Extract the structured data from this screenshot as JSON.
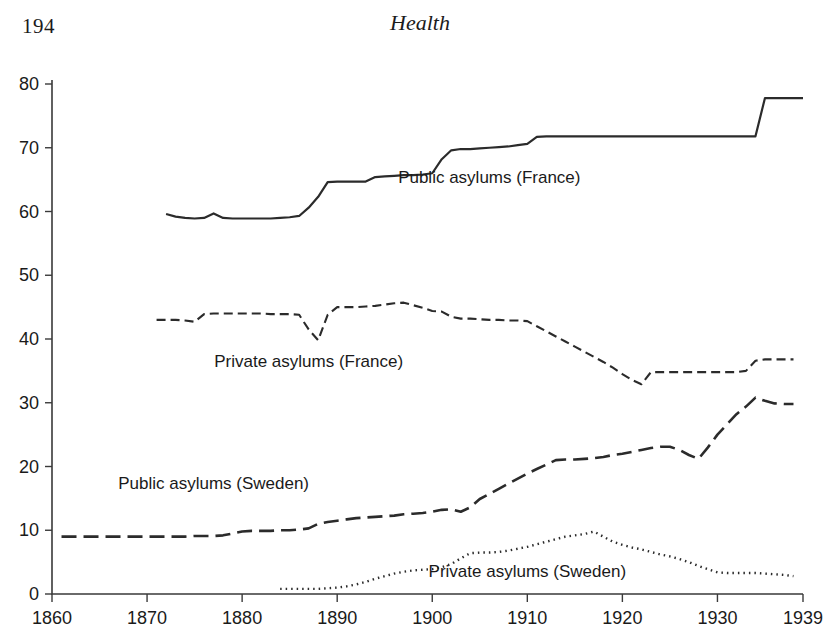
{
  "page": {
    "folio": "194",
    "running_head": "Health"
  },
  "chart_data": {
    "type": "line",
    "title": "",
    "xlabel": "",
    "ylabel": "",
    "xlim": [
      1860,
      1939
    ],
    "ylim": [
      0,
      80
    ],
    "grid": false,
    "legend_position": "inline-annotations",
    "x_ticks": [
      "1860",
      "1870",
      "1880",
      "1890",
      "1900",
      "1910",
      "1920",
      "1930",
      "1939"
    ],
    "x_tick_values": [
      1860,
      1870,
      1880,
      1890,
      1900,
      1910,
      1920,
      1930,
      1939
    ],
    "y_ticks": [
      "0",
      "10",
      "20",
      "30",
      "40",
      "50",
      "60",
      "70",
      "80"
    ],
    "y_tick_values": [
      0,
      10,
      20,
      30,
      40,
      50,
      60,
      70,
      80
    ],
    "series": [
      {
        "name": "Public asylums (France)",
        "style": "solid",
        "label_x": 1906,
        "label_y": 64.5,
        "x": [
          1872,
          1873,
          1874,
          1875,
          1876,
          1877,
          1878,
          1879,
          1880,
          1881,
          1882,
          1883,
          1884,
          1885,
          1886,
          1887,
          1888,
          1889,
          1890,
          1891,
          1892,
          1893,
          1894,
          1895,
          1896,
          1897,
          1898,
          1899,
          1900,
          1901,
          1902,
          1903,
          1904,
          1905,
          1906,
          1907,
          1908,
          1909,
          1910,
          1911,
          1912,
          1913,
          1914,
          1915,
          1916,
          1917,
          1918,
          1919,
          1920,
          1921,
          1922,
          1923,
          1924,
          1925,
          1926,
          1927,
          1928,
          1929,
          1930,
          1931,
          1932,
          1933,
          1934,
          1935,
          1936,
          1937,
          1938,
          1939
        ],
        "values": [
          59.6,
          59.2,
          59.0,
          58.9,
          59.0,
          59.7,
          59.0,
          58.9,
          58.9,
          58.9,
          58.9,
          58.9,
          59.0,
          59.1,
          59.3,
          60.6,
          62.3,
          64.6,
          64.7,
          64.7,
          64.7,
          64.7,
          65.4,
          65.5,
          65.6,
          65.7,
          65.7,
          65.8,
          66.0,
          68.2,
          69.6,
          69.8,
          69.8,
          69.9,
          70.0,
          70.1,
          70.2,
          70.4,
          70.6,
          71.7,
          71.8,
          71.8,
          71.8,
          71.8,
          71.8,
          71.8,
          71.8,
          71.8,
          71.8,
          71.8,
          71.8,
          71.8,
          71.8,
          71.8,
          71.8,
          71.8,
          71.8,
          71.8,
          71.8,
          71.8,
          71.8,
          71.8,
          71.8,
          77.8,
          77.8,
          77.8,
          77.8,
          77.8
        ]
      },
      {
        "name": "Private asylums (France)",
        "style": "dashed",
        "label_x": 1887,
        "label_y": 35.6,
        "x": [
          1871,
          1872,
          1873,
          1874,
          1875,
          1876,
          1877,
          1878,
          1879,
          1880,
          1881,
          1882,
          1883,
          1884,
          1885,
          1886,
          1887,
          1888,
          1889,
          1890,
          1891,
          1892,
          1893,
          1894,
          1895,
          1896,
          1897,
          1898,
          1899,
          1900,
          1901,
          1902,
          1903,
          1904,
          1905,
          1906,
          1907,
          1908,
          1909,
          1910,
          1911,
          1912,
          1913,
          1914,
          1915,
          1916,
          1917,
          1918,
          1919,
          1920,
          1921,
          1922,
          1923,
          1924,
          1925,
          1926,
          1927,
          1928,
          1929,
          1930,
          1931,
          1932,
          1933,
          1934,
          1935,
          1936,
          1937,
          1938
        ],
        "values": [
          43.0,
          43.0,
          43.0,
          42.9,
          42.7,
          43.9,
          44.0,
          44.0,
          44.0,
          44.0,
          44.0,
          44.0,
          43.9,
          43.9,
          43.9,
          43.8,
          41.5,
          39.8,
          43.8,
          45.0,
          45.0,
          45.0,
          45.1,
          45.2,
          45.4,
          45.6,
          45.7,
          45.3,
          44.9,
          44.4,
          44.3,
          43.5,
          43.2,
          43.2,
          43.1,
          43.0,
          43.0,
          42.9,
          42.9,
          42.8,
          42.0,
          41.2,
          40.4,
          39.6,
          38.8,
          38.0,
          37.2,
          36.4,
          35.5,
          34.5,
          33.6,
          32.9,
          34.8,
          34.8,
          34.8,
          34.8,
          34.8,
          34.8,
          34.8,
          34.8,
          34.8,
          34.8,
          35.0,
          36.6,
          36.8,
          36.8,
          36.8,
          36.8
        ]
      },
      {
        "name": "Public asylums (Sweden)",
        "style": "longdash",
        "label_x": 1877,
        "label_y": 16.4,
        "x": [
          1861,
          1862,
          1863,
          1864,
          1865,
          1866,
          1867,
          1868,
          1869,
          1870,
          1871,
          1872,
          1873,
          1874,
          1875,
          1876,
          1877,
          1878,
          1879,
          1880,
          1881,
          1882,
          1883,
          1884,
          1885,
          1886,
          1887,
          1888,
          1889,
          1890,
          1891,
          1892,
          1893,
          1894,
          1895,
          1896,
          1897,
          1898,
          1899,
          1900,
          1901,
          1902,
          1903,
          1904,
          1905,
          1906,
          1907,
          1908,
          1909,
          1910,
          1911,
          1912,
          1913,
          1914,
          1915,
          1916,
          1917,
          1918,
          1919,
          1920,
          1921,
          1922,
          1923,
          1924,
          1925,
          1926,
          1927,
          1928,
          1929,
          1930,
          1931,
          1932,
          1933,
          1934,
          1935,
          1936,
          1937,
          1938
        ],
        "values": [
          9.0,
          9.0,
          9.0,
          9.0,
          9.0,
          9.0,
          9.0,
          9.0,
          9.0,
          9.0,
          9.0,
          9.0,
          9.0,
          9.0,
          9.1,
          9.1,
          9.1,
          9.2,
          9.5,
          9.8,
          9.9,
          9.9,
          9.9,
          10.0,
          10.0,
          10.1,
          10.3,
          11.0,
          11.3,
          11.5,
          11.7,
          11.9,
          12.0,
          12.1,
          12.2,
          12.3,
          12.5,
          12.6,
          12.7,
          12.9,
          13.2,
          13.3,
          12.9,
          13.6,
          14.9,
          15.7,
          16.5,
          17.3,
          18.1,
          18.9,
          19.6,
          20.3,
          21.0,
          21.1,
          21.1,
          21.2,
          21.3,
          21.5,
          21.8,
          22.0,
          22.3,
          22.6,
          22.9,
          23.1,
          23.1,
          22.6,
          21.8,
          21.2,
          23.0,
          25.0,
          26.6,
          28.2,
          29.4,
          30.8,
          30.3,
          29.9,
          29.8,
          29.8
        ]
      },
      {
        "name": "Private asylums (Sweden)",
        "style": "dotted",
        "label_x": 1910,
        "label_y": 2.6,
        "x": [
          1884,
          1885,
          1886,
          1887,
          1888,
          1889,
          1890,
          1891,
          1892,
          1893,
          1894,
          1895,
          1896,
          1897,
          1898,
          1899,
          1900,
          1901,
          1902,
          1903,
          1904,
          1905,
          1906,
          1907,
          1908,
          1909,
          1910,
          1911,
          1912,
          1913,
          1914,
          1915,
          1916,
          1917,
          1918,
          1919,
          1920,
          1921,
          1922,
          1923,
          1924,
          1925,
          1926,
          1927,
          1928,
          1929,
          1930,
          1931,
          1932,
          1933,
          1934,
          1935,
          1936,
          1937,
          1938
        ],
        "values": [
          0.8,
          0.8,
          0.8,
          0.8,
          0.8,
          0.9,
          1.0,
          1.2,
          1.5,
          1.9,
          2.4,
          2.8,
          3.2,
          3.5,
          3.7,
          3.8,
          3.9,
          4.2,
          4.7,
          5.6,
          6.4,
          6.5,
          6.5,
          6.6,
          6.8,
          7.1,
          7.4,
          7.8,
          8.2,
          8.6,
          9.0,
          9.2,
          9.4,
          9.8,
          9.0,
          8.2,
          7.7,
          7.3,
          7.0,
          6.6,
          6.2,
          5.9,
          5.5,
          5.0,
          4.4,
          3.9,
          3.4,
          3.3,
          3.3,
          3.3,
          3.3,
          3.2,
          3.1,
          3.0,
          2.8
        ]
      }
    ]
  }
}
